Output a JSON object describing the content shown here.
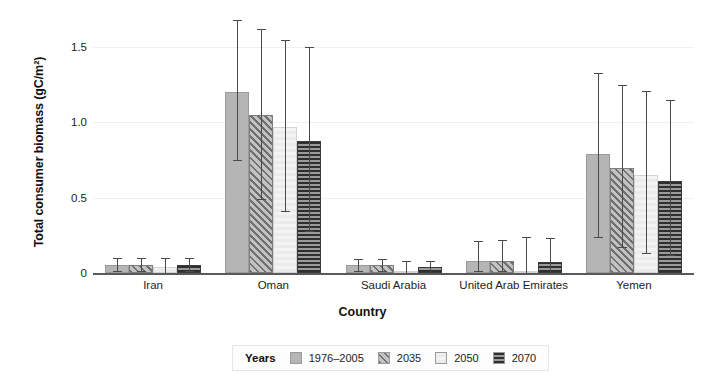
{
  "chart_data": {
    "type": "bar",
    "title": "",
    "xlabel": "Country",
    "ylabel": "Total consumer biomass (gC/m²)",
    "categories": [
      "Iran",
      "Oman",
      "Saudi Arabia",
      "United Arab Emirates",
      "Yemen"
    ],
    "ylim": [
      0,
      1.72
    ],
    "yticks": [
      0,
      0.5,
      1.0,
      1.5
    ],
    "ytick_labels": [
      "0",
      "0.5",
      "1.0",
      "1.5"
    ],
    "grid": "horizontal-light",
    "legend_position": "bottom-center",
    "legend_title": "Years",
    "error_bars": "asymmetric-range",
    "series": [
      {
        "name": "1976–2005",
        "pattern": "solid-gray",
        "color": "#b5b5b5",
        "values": [
          0.05,
          1.2,
          0.05,
          0.08,
          0.79
        ],
        "err_low": [
          0.01,
          0.75,
          0.01,
          0.01,
          0.24
        ],
        "err_high": [
          0.1,
          1.68,
          0.09,
          0.21,
          1.33
        ]
      },
      {
        "name": "2035",
        "pattern": "diagonal-hatch",
        "color": "#6f6f6f",
        "values": [
          0.05,
          1.05,
          0.05,
          0.08,
          0.7
        ],
        "err_low": [
          0.01,
          0.49,
          0.01,
          0.01,
          0.17
        ],
        "err_high": [
          0.1,
          1.62,
          0.09,
          0.22,
          1.25
        ]
      },
      {
        "name": "2050",
        "pattern": "light-checker",
        "color": "#eeeeee",
        "values": [
          0.04,
          0.97,
          0.01,
          0.01,
          0.65
        ],
        "err_low": [
          0.0,
          0.41,
          0.0,
          0.0,
          0.13
        ],
        "err_high": [
          0.1,
          1.55,
          0.08,
          0.24,
          1.21
        ]
      },
      {
        "name": "2070",
        "pattern": "horizontal-stripe",
        "color": "#2f2f2f",
        "values": [
          0.05,
          0.88,
          0.04,
          0.07,
          0.61
        ],
        "err_low": [
          0.01,
          0.28,
          0.0,
          0.0,
          0.12
        ],
        "err_high": [
          0.1,
          1.5,
          0.08,
          0.23,
          1.15
        ]
      }
    ]
  },
  "axis": {
    "y_title": "Total consumer biomass (gC/m²)",
    "x_title": "Country",
    "ytick_0": "0",
    "ytick_1": "0.5",
    "ytick_2": "1.0",
    "ytick_3": "1.5"
  },
  "legend": {
    "title": "Years",
    "items": [
      {
        "label": "1976–2005",
        "pattern": "solid-gray"
      },
      {
        "label": "2035",
        "pattern": "diagonal-hatch"
      },
      {
        "label": "2050",
        "pattern": "light-checker"
      },
      {
        "label": "2070",
        "pattern": "horizontal-stripe"
      }
    ]
  }
}
